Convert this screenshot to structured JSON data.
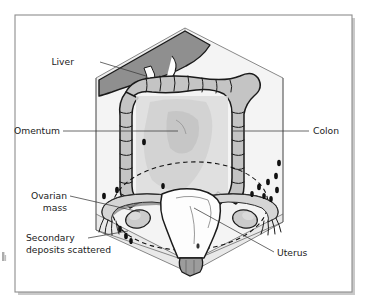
{
  "figure": {
    "kind": "medical-illustration",
    "view": "anterior cut-away of abdomen shown inside a hexagonal box"
  },
  "labels": {
    "liver": "Liver",
    "omentum": "Omentum",
    "colon": "Colon",
    "ovarian_mass_line1": "Ovarian",
    "ovarian_mass_line2": "mass",
    "secondary_line1": "Secondary",
    "secondary_line2": "deposits scattered",
    "uterus": "Uterus"
  },
  "colors": {
    "frame_border": "#8d8d8d",
    "frame_shadow": "#c9c9c9",
    "page_background": "#ffffff",
    "label_text": "#222222",
    "leader_line": "#3a3a3a",
    "organ_outline": "#1a1a1a",
    "liver_fill": "#8f8f8f",
    "colon_fill": "#c4c4c4",
    "omentum_fill": "#d8d8d8",
    "box_face_fill": "#f2f2f2",
    "box_side_fill": "#ececec",
    "uterus_fill": "#fdfdfd",
    "ovary_fill": "#cfcfcf",
    "deposit_fill": "#111111"
  },
  "structures": [
    {
      "name": "liver",
      "description": "dark grey wedge upper left of cavity"
    },
    {
      "name": "colon",
      "description": "haustrated large bowel framing the cavity"
    },
    {
      "name": "omentum",
      "description": "pale apron of fatty tissue in centre"
    },
    {
      "name": "uterus",
      "description": "pear-shaped organ at pelvic floor"
    },
    {
      "name": "ovarian-mass-left",
      "description": "enlarged left ovary"
    },
    {
      "name": "ovarian-mass-right",
      "description": "enlarged right ovary"
    },
    {
      "name": "fallopian-tube-left",
      "description": "tube running to left ovary"
    },
    {
      "name": "fallopian-tube-right",
      "description": "tube running to right ovary"
    },
    {
      "name": "secondary-deposits",
      "description": "scattered small dark nodules on peritoneum"
    },
    {
      "name": "dashed-spread-ellipse",
      "description": "dashed ellipse outlining area of tumour spread"
    }
  ],
  "deposit_count": 16
}
